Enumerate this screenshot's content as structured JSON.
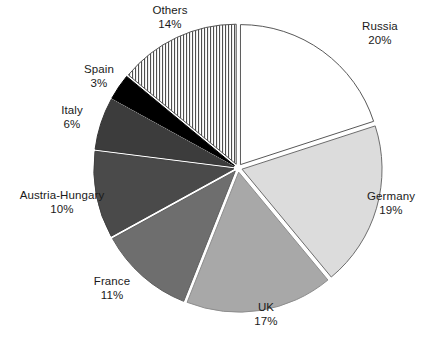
{
  "chart_data": {
    "type": "pie",
    "title": "",
    "subtitle": "",
    "xlabel": "",
    "ylabel": "",
    "legend_position": "none",
    "grid": false,
    "label_format": "name + percent",
    "categories": [
      "Russia",
      "Germany",
      "UK",
      "France",
      "Austria-Hungary",
      "Italy",
      "Spain",
      "Others"
    ],
    "values": [
      20,
      19,
      17,
      11,
      10,
      6,
      3,
      14
    ],
    "unit": "%",
    "total": 100,
    "slices": [
      {
        "name": "Russia",
        "percent": 20,
        "label": "Russia",
        "pct_label": "20%",
        "fill": "#ffffff",
        "pattern": "solid",
        "stroke": "#585858"
      },
      {
        "name": "Germany",
        "percent": 19,
        "label": "Germany",
        "pct_label": "19%",
        "fill": "#dcdcdc",
        "pattern": "solid",
        "stroke": "#6d6d6d"
      },
      {
        "name": "UK",
        "percent": 17,
        "label": "UK",
        "pct_label": "17%",
        "fill": "#a8a8a8",
        "pattern": "solid",
        "stroke": "#8d8d8d"
      },
      {
        "name": "France",
        "percent": 11,
        "label": "France",
        "pct_label": "11%",
        "fill": "#6e6e6e",
        "pattern": "solid",
        "stroke": "#5f5f5f"
      },
      {
        "name": "Austria-Hungary",
        "percent": 10,
        "label": "Austria-Hungary",
        "pct_label": "10%",
        "fill": "#4a4a4a",
        "pattern": "solid",
        "stroke": "#414141"
      },
      {
        "name": "Italy",
        "percent": 6,
        "label": "Italy",
        "pct_label": "6%",
        "fill": "#3c3c3c",
        "pattern": "solid",
        "stroke": "#343434"
      },
      {
        "name": "Spain",
        "percent": 3,
        "label": "Spain",
        "pct_label": "3%",
        "fill": "#000000",
        "pattern": "solid",
        "stroke": "#000000"
      },
      {
        "name": "Others",
        "percent": 14,
        "label": "Others",
        "pct_label": "14%",
        "fill": "#ffffff",
        "pattern": "vertical-stripes",
        "stroke": "#555555"
      }
    ]
  },
  "caption": {
    "text": ""
  }
}
